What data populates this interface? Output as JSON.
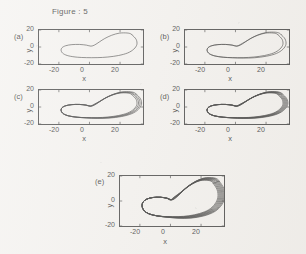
{
  "figure": {
    "title": "Figure : 5",
    "axis_label_x": "x",
    "axis_label_y": "y",
    "line_color": "#1a1a1a",
    "background_color": "#f3f1ee"
  },
  "panels": [
    {
      "tag": "(a)",
      "xticks": [
        "-20",
        "0",
        "20"
      ],
      "yticks": [
        "20",
        "0",
        "-20"
      ]
    },
    {
      "tag": "(b)",
      "xticks": [
        "-20",
        "0",
        "20"
      ],
      "yticks": [
        "20",
        "0",
        "-20"
      ]
    },
    {
      "tag": "(c)",
      "xticks": [
        "-20",
        "0",
        "20"
      ],
      "yticks": [
        "20",
        "0",
        "-20"
      ]
    },
    {
      "tag": "(d)",
      "xticks": [
        "-20",
        "0",
        "20"
      ],
      "yticks": [
        "20",
        "0",
        "-20"
      ]
    },
    {
      "tag": "(e)",
      "xticks": [
        "-20",
        "0",
        "20"
      ],
      "yticks": [
        "20",
        "0",
        "-20"
      ]
    }
  ],
  "chart_data": {
    "type": "line",
    "title": "Figure : 5",
    "xlabel": "x",
    "ylabel": "y",
    "xlim": [
      -33,
      35
    ],
    "ylim": [
      -20,
      20
    ],
    "xticks": [
      -20,
      0,
      20
    ],
    "yticks": [
      -20,
      0,
      20
    ],
    "grid": false,
    "legend": null,
    "subplots": [
      {
        "tag": "(a)",
        "n_bands": 1,
        "band_spread": 0.0,
        "caption": "period-1 limit cycle, single closed loop"
      },
      {
        "tag": "(b)",
        "n_bands": 2,
        "band_spread": 2.0,
        "caption": "period-2 orbit, loop split into two nearby strands"
      },
      {
        "tag": "(c)",
        "n_bands": 4,
        "band_spread": 3.0,
        "caption": "period-4 orbit, four strands visible on the right lobe"
      },
      {
        "tag": "(d)",
        "n_bands": 6,
        "band_spread": 3.2,
        "caption": "period-8 / multi-band orbit, tightly packed strands"
      },
      {
        "tag": "(e)",
        "n_bands": 8,
        "band_spread": 4.6,
        "caption": "chaotic attractor, dense band of many strands"
      }
    ],
    "orbit_outline": {
      "comment": "Normalised base orbit shape in data units (x,y) traced counter-clockwise; large right lobe peaking near x=28,y=17 and a smaller left lobe near x=-18,y=-3, with a waist crossing near x=0.",
      "points": [
        [
          28.0,
          14.0
        ],
        [
          30.5,
          9.0
        ],
        [
          31.0,
          3.0
        ],
        [
          29.0,
          -2.5
        ],
        [
          25.0,
          -7.0
        ],
        [
          19.0,
          -10.0
        ],
        [
          12.0,
          -11.8
        ],
        [
          5.0,
          -12.5
        ],
        [
          -2.0,
          -12.5
        ],
        [
          -8.0,
          -12.0
        ],
        [
          -13.5,
          -10.5
        ],
        [
          -17.0,
          -8.0
        ],
        [
          -18.5,
          -4.5
        ],
        [
          -18.0,
          -1.0
        ],
        [
          -15.5,
          1.5
        ],
        [
          -11.5,
          2.8
        ],
        [
          -6.5,
          3.0
        ],
        [
          -2.0,
          2.2
        ],
        [
          1.0,
          1.0
        ],
        [
          3.5,
          2.5
        ],
        [
          6.5,
          6.0
        ],
        [
          10.0,
          10.0
        ],
        [
          14.5,
          13.8
        ],
        [
          19.5,
          16.3
        ],
        [
          24.5,
          16.5
        ],
        [
          27.0,
          15.5
        ],
        [
          28.0,
          14.0
        ]
      ]
    }
  }
}
